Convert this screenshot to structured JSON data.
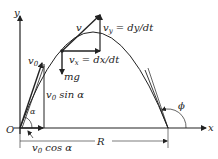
{
  "diagram": {
    "axes": {
      "x_label": "x",
      "y_label": "y",
      "origin_label": "O"
    },
    "labels": {
      "v": "v",
      "vy": "v",
      "vy_sub": "y",
      "vy_eq": " = dy/dt",
      "vx": "v",
      "vx_sub": "x",
      "vx_eq": " = dx/dt",
      "mg": "mg",
      "v0": "v",
      "v0_sub": "0",
      "v0sin": "v",
      "v0sin_sub": "0",
      "v0sin_rest": " sin α",
      "v0cos": "v",
      "v0cos_sub": "0",
      "v0cos_rest": " cos α",
      "alpha": "α",
      "phi": "ϕ",
      "range": "R"
    },
    "colors": {
      "line": "#222222",
      "background": "#ffffff"
    }
  }
}
